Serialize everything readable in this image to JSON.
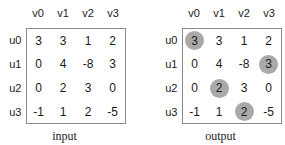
{
  "figure": {
    "column_headers": [
      "v0",
      "v1",
      "v2",
      "v3"
    ],
    "row_labels": [
      "u0",
      "u1",
      "u2",
      "u3"
    ],
    "highlight_color": "#a9a9a9",
    "border_color": "#8a8a8a",
    "matrices": [
      {
        "caption": "input",
        "rows": [
          [
            "3",
            "3",
            "1",
            "2"
          ],
          [
            "0",
            "4",
            "-8",
            "3"
          ],
          [
            "0",
            "2",
            "3",
            "0"
          ],
          [
            "-1",
            "1",
            "2",
            "-5"
          ]
        ],
        "highlights": []
      },
      {
        "caption": "output",
        "rows": [
          [
            "3",
            "3",
            "1",
            "2"
          ],
          [
            "0",
            "4",
            "-8",
            "3"
          ],
          [
            "0",
            "2",
            "3",
            "0"
          ],
          [
            "-1",
            "1",
            "2",
            "-5"
          ]
        ],
        "highlights": [
          {
            "row": 0,
            "col": 0,
            "value": "3"
          },
          {
            "row": 1,
            "col": 3,
            "value": "3"
          },
          {
            "row": 2,
            "col": 1,
            "value": "2"
          },
          {
            "row": 3,
            "col": 2,
            "value": "2"
          }
        ]
      }
    ]
  }
}
